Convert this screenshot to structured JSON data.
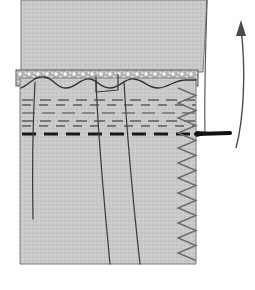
{
  "figure": {
    "background_color": "#ffffff",
    "ink_color": "#3a3a3a",
    "bold_ink_color": "#1a1a1a"
  },
  "fabrics": {
    "upper_panel": {
      "name": "waistband-upper-panel",
      "fill": "#c9c9c9",
      "stroke": "#6f6f6f",
      "outline": "M 21,0 L 207,0 L 203,72 L 21,72 Z"
    },
    "lower_panel": {
      "name": "skirt-lower-panel",
      "fill": "#c9c9c9",
      "stroke": "#6f6f6f",
      "outline": "M 20,78 L 196,78 L 196,264 L 20,264 Z"
    },
    "seam_allowance_band": {
      "name": "raw-edge-seam-allowance",
      "fill": "#b5b5b5",
      "speckle_color": "#ffffff",
      "top_y": 70,
      "bottom_y": 86
    }
  },
  "stitch_rows": {
    "note": "Rows of gathering / basting dashes across the panel",
    "rows": [
      {
        "y": 100,
        "weight": 1.6,
        "color": "#5d5d5d",
        "dash": "11 7",
        "x_start": 22,
        "x_end": 196
      },
      {
        "y": 105,
        "weight": 1.5,
        "color": "#5d5d5d",
        "dash": "9 8",
        "x_start": 22,
        "x_end": 196
      },
      {
        "y": 113,
        "weight": 1.2,
        "color": "#4a4a4a",
        "dash": "13 7",
        "x_start": 22,
        "x_end": 196
      },
      {
        "y": 121,
        "weight": 1.6,
        "color": "#5d5d5d",
        "dash": "11 7",
        "x_start": 22,
        "x_end": 196
      },
      {
        "y": 126,
        "weight": 1.5,
        "color": "#5d5d5d",
        "dash": "9 8",
        "x_start": 22,
        "x_end": 196
      },
      {
        "y": 134,
        "weight": 3.0,
        "color": "#181818",
        "dash": "14 8",
        "x_start": 22,
        "x_end": 196
      }
    ]
  },
  "pleat_lines": [
    {
      "name": "pleat-fold-line-1",
      "path": "M 35,82 C 33,120 32,170 33,219"
    },
    {
      "name": "pleat-fold-line-2",
      "path": "M 96,80 C 98,140 104,200 110,264"
    },
    {
      "name": "pleat-fold-line-3",
      "path": "M 124,82 C 128,150 134,210 140,264"
    }
  ],
  "pleat_tuck": {
    "name": "pleat-tuck-notch",
    "path": "M 96,76 L 96,92 L 118,90 L 118,74"
  },
  "wavy_edge": {
    "name": "gathered-wavy-edge-line",
    "path": "M 21,88 C 30,84 34,76 44,77 C 54,78 56,88 66,88 C 76,88 80,78 90,79 C 98,80 100,88 110,88 C 120,88 124,78 134,79 C 144,80 148,88 158,88 C 168,88 174,80 186,80 L 196,80"
  },
  "zigzag": {
    "name": "zigzag-overlock-stitch",
    "color": "#6b6b6b",
    "x_center": 187,
    "amplitude": 9,
    "y_start": 88,
    "y_end": 264,
    "period": 15
  },
  "arrows": {
    "curved_up_arrow": {
      "name": "curved-up-fold-arrow",
      "label": "fold waistband up",
      "path": "M 236,148 C 244,118 246,70 241,28",
      "head": "M 241,20 L 236,36 L 246,36 Z",
      "color": "#4a4a4a"
    },
    "straight_pull_arrow": {
      "name": "horizontal-pull-arrow",
      "label": "pull seam allowance",
      "path": "M 196,134 L 230,133",
      "color": "#121212"
    },
    "panel_edge_guide": {
      "name": "upper-panel-edge-guide-line",
      "path": "M 207,0 C 206,40 204,90 205,134",
      "color": "#5b5b5b"
    }
  }
}
